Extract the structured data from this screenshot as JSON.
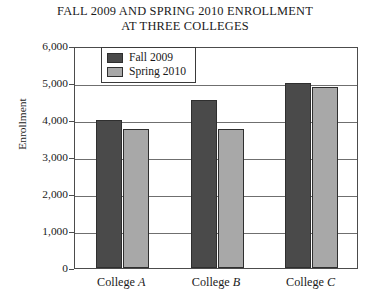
{
  "chart_data": {
    "type": "bar",
    "title": "FALL 2009 AND SPRING 2010 ENROLLMENT AT THREE COLLEGES",
    "title_lines": [
      "FALL 2009 AND SPRING 2010 ENROLLMENT",
      "AT THREE COLLEGES"
    ],
    "xlabel": "",
    "ylabel": "Enrollment",
    "categories": [
      "College A",
      "College B",
      "College C"
    ],
    "category_prefix": "College",
    "category_letters": [
      "A",
      "B",
      "C"
    ],
    "series": [
      {
        "name": "Fall 2009",
        "color": "#4a4a4a",
        "values": [
          4000,
          4550,
          5000
        ]
      },
      {
        "name": "Spring 2010",
        "color": "#a8a8a8",
        "values": [
          3750,
          3750,
          4900
        ]
      }
    ],
    "ylim": [
      0,
      6000
    ],
    "ytick_step": 1000,
    "ytick_labels": [
      "6,000",
      "5,000",
      "4,000",
      "3,000",
      "2,000",
      "1,000",
      "0"
    ],
    "ytick_values": [
      6000,
      5000,
      4000,
      3000,
      2000,
      1000,
      0
    ],
    "grid": true,
    "grid_axis": "y",
    "legend_position": "top-left-inside"
  }
}
